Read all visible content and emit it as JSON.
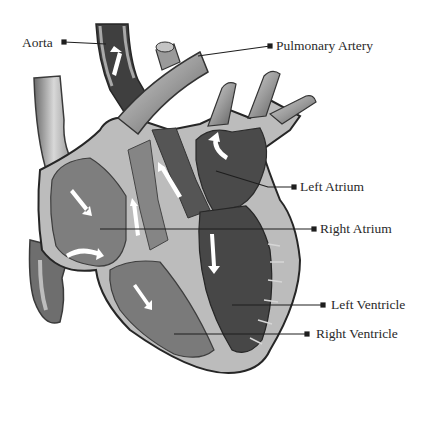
{
  "diagram": {
    "labels": [
      {
        "id": "aorta",
        "text": "Aorta",
        "x": 22,
        "y": 37
      },
      {
        "id": "pulmonary-artery",
        "text": "Pulmonary Artery",
        "x": 276,
        "y": 40
      },
      {
        "id": "left-atrium",
        "text": "Left Atrium",
        "x": 300,
        "y": 180
      },
      {
        "id": "right-atrium",
        "text": "Right Atrium",
        "x": 320,
        "y": 222
      },
      {
        "id": "left-ventricle",
        "text": "Left Ventricle",
        "x": 331,
        "y": 298
      },
      {
        "id": "right-ventricle",
        "text": "Right Ventricle",
        "x": 316,
        "y": 328
      }
    ],
    "leaders": [
      {
        "id": "aorta",
        "x1": 64,
        "y1": 42,
        "x2": 106,
        "y2": 44
      },
      {
        "id": "pulmonary-artery",
        "x1": 270,
        "y1": 46,
        "x2": 198,
        "y2": 56
      },
      {
        "id": "left-atrium",
        "x1": 294,
        "y1": 187,
        "x2": 268,
        "y2": 187,
        "x3": 216,
        "y3": 171
      },
      {
        "id": "right-atrium",
        "x1": 314,
        "y1": 229,
        "x2": 100,
        "y2": 229
      },
      {
        "id": "left-ventricle",
        "x1": 323,
        "y1": 305,
        "x2": 232,
        "y2": 305
      },
      {
        "id": "right-ventricle",
        "x1": 307,
        "y1": 334,
        "x2": 174,
        "y2": 334
      }
    ],
    "colors": {
      "background": "#ffffff",
      "label_text": "#2a2a2a",
      "leader_line": "#1e1e1e",
      "dark_chamber": "#4a4a4a",
      "mid_chamber": "#7d7d7d",
      "wall_light": "#b8b8b8",
      "vessel": "#9a9a9a",
      "outline": "#2b2b2b",
      "arrow": "#ffffff"
    }
  }
}
